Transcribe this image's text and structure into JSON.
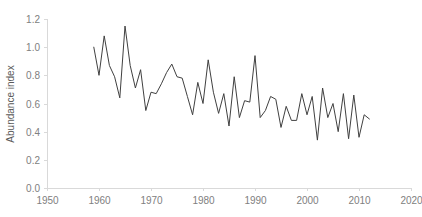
{
  "chart_data": {
    "type": "line",
    "title": "",
    "subtitle": "",
    "xlabel": "",
    "ylabel": "Abundance index",
    "xlim": [
      1950,
      2020
    ],
    "ylim": [
      0.0,
      1.2
    ],
    "xticks": [
      1950,
      1960,
      1970,
      1980,
      1990,
      2000,
      2010,
      2020
    ],
    "xtick_labels": [
      "1950",
      "1960",
      "1970",
      "1980",
      "1990",
      "2000",
      "2010",
      "2020"
    ],
    "yticks": [
      0.0,
      0.2,
      0.4,
      0.6,
      0.8,
      1.0,
      1.2
    ],
    "ytick_labels": [
      "0.0",
      "0.2",
      "0.4",
      "0.6",
      "0.8",
      "1.0",
      "1.2"
    ],
    "grid": false,
    "legend": false,
    "legend_position": "none",
    "line_color": "#404040",
    "axis_color": "#d9d9d9",
    "tick_label_color": "#808080",
    "axis_title_color": "#595959",
    "background_color": "#ffffff",
    "series": [
      {
        "name": "Abundance index",
        "x": [
          1959,
          1960,
          1961,
          1962,
          1963,
          1964,
          1965,
          1966,
          1967,
          1968,
          1969,
          1970,
          1971,
          1972,
          1973,
          1974,
          1975,
          1976,
          1977,
          1978,
          1979,
          1980,
          1981,
          1982,
          1983,
          1984,
          1985,
          1986,
          1987,
          1988,
          1989,
          1990,
          1991,
          1992,
          1993,
          1994,
          1995,
          1996,
          1997,
          1998,
          1999,
          2000,
          2001,
          2002,
          2003,
          2004,
          2005,
          2006,
          2007,
          2008,
          2009,
          2010,
          2011,
          2012
        ],
        "values": [
          1.0,
          0.8,
          1.08,
          0.87,
          0.79,
          0.64,
          1.15,
          0.87,
          0.71,
          0.84,
          0.55,
          0.68,
          0.67,
          0.74,
          0.82,
          0.88,
          0.79,
          0.78,
          0.65,
          0.52,
          0.75,
          0.6,
          0.91,
          0.68,
          0.53,
          0.67,
          0.44,
          0.79,
          0.5,
          0.62,
          0.61,
          0.94,
          0.5,
          0.55,
          0.65,
          0.63,
          0.43,
          0.58,
          0.48,
          0.48,
          0.67,
          0.52,
          0.65,
          0.34,
          0.71,
          0.5,
          0.6,
          0.4,
          0.67,
          0.35,
          0.66,
          0.36,
          0.52,
          0.49
        ]
      }
    ]
  }
}
